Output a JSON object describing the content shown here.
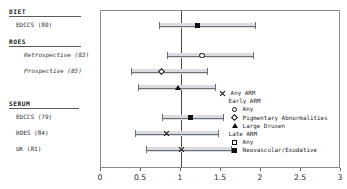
{
  "chart_data": {
    "type": "scatter",
    "title": "",
    "xlabel": "",
    "ylabel": "",
    "xlim": [
      0,
      3
    ],
    "xticks": [
      0,
      0.5,
      1,
      1.5,
      2,
      2.5,
      3
    ],
    "xtick_labels": [
      "0",
      "0.5",
      "1",
      "1.5",
      "2",
      "2.5",
      "3"
    ],
    "reference_line": 1,
    "grid": false,
    "legend_position": "inside-right",
    "orientation": "horizontal-forest",
    "groups": [
      {
        "heading": "DIET",
        "rows": [
          {
            "label": "EDCCS (80)",
            "indent": 1,
            "italic": false,
            "estimate": 1.2,
            "ci_low": 0.72,
            "ci_high": 1.92,
            "marker": "filled-square",
            "series": "Neovascular/Exudative"
          }
        ]
      },
      {
        "heading": "ROES",
        "rows": [
          {
            "label": "Retrospective (83)",
            "indent": 2,
            "italic": true,
            "estimate": 1.26,
            "ci_low": 0.82,
            "ci_high": 1.9,
            "marker": "open-circle",
            "series": "Early ARM Any"
          },
          {
            "label": "Prospective (85)",
            "indent": 2,
            "italic": true,
            "estimate": 0.76,
            "ci_low": 0.38,
            "ci_high": 1.32,
            "marker": "open-diamond",
            "series": "Pigmentary Abnormalities"
          },
          {
            "label": "",
            "indent": 2,
            "italic": true,
            "estimate": 0.96,
            "ci_low": 0.46,
            "ci_high": 1.42,
            "marker": "filled-triangle",
            "series": "Large Drusen"
          }
        ]
      },
      {
        "heading": "SERUM",
        "rows": [
          {
            "label": "EDCCS (79)",
            "indent": 1,
            "italic": false,
            "estimate": 1.12,
            "ci_low": 0.76,
            "ci_high": 1.52,
            "marker": "filled-square",
            "series": "Neovascular/Exudative"
          },
          {
            "label": "ROES (84)",
            "indent": 1,
            "italic": false,
            "estimate": 0.82,
            "ci_low": 0.42,
            "ci_high": 1.46,
            "marker": "cross-x",
            "series": "Any ARM"
          },
          {
            "label": "UK (81)",
            "indent": 1,
            "italic": false,
            "estimate": 1.0,
            "ci_low": 0.56,
            "ci_high": 1.62,
            "marker": "cross-x",
            "series": "Any ARM"
          }
        ]
      }
    ],
    "legend": [
      {
        "glyph": "cross-x",
        "label": "Any ARM",
        "level": 0,
        "is_header": false
      },
      {
        "glyph": "",
        "label": "Early ARM",
        "level": 1,
        "is_header": true
      },
      {
        "glyph": "open-circle",
        "label": "Any",
        "level": 2,
        "is_header": false
      },
      {
        "glyph": "open-diamond",
        "label": "Pigmentary Abnormalities",
        "level": 2,
        "is_header": false
      },
      {
        "glyph": "filled-triangle",
        "label": "Large Drusen",
        "level": 2,
        "is_header": false
      },
      {
        "glyph": "",
        "label": "Late ARM",
        "level": 1,
        "is_header": true
      },
      {
        "glyph": "open-square",
        "label": "Any",
        "level": 2,
        "is_header": false
      },
      {
        "glyph": "filled-square",
        "label": "Neovascular/Exudative",
        "level": 2,
        "is_header": false
      }
    ]
  },
  "colors": {
    "marker": "#111111",
    "ci_band": "#d8dde3",
    "ci_line": "#6f6f6f",
    "frame": "#8a8a8a",
    "reference_line": "#4a4a4a",
    "text": "#1f1f1f"
  }
}
